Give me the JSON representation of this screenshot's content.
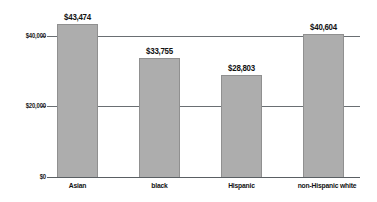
{
  "chart_data": {
    "type": "bar",
    "title": "",
    "xlabel": "",
    "ylabel": "",
    "categories": [
      "Asian",
      "black",
      "Hispanic",
      "non-Hispanic white"
    ],
    "values": [
      43474,
      40604,
      33755,
      28803
    ],
    "series": [
      {
        "name": "Median income",
        "values": [
          43474,
          33755,
          28803,
          40604
        ]
      }
    ],
    "value_labels": [
      "$43,474",
      "$33,755",
      "$28,803",
      "$40,604"
    ],
    "ylim": [
      0,
      48000
    ],
    "yticks": [
      0,
      20000,
      40000
    ],
    "ytick_labels": [
      "$0",
      "$20,000",
      "$40,000"
    ],
    "grid": true,
    "gridlines_at": [
      20000,
      40000
    ],
    "legend": "none",
    "bar_color": "#adadad",
    "bar_border_color": "#909090",
    "axis_color": "#5a5f63",
    "text_color": "#111111",
    "background": "#ffffff"
  },
  "axis": {
    "y_labels": {
      "t40": "$40,000",
      "t20": "$20,000",
      "t0": "$0"
    }
  },
  "bars": [
    {
      "category": "Asian",
      "label": "$43,474",
      "value": 43474
    },
    {
      "category": "black",
      "label": "$33,755",
      "value": 33755
    },
    {
      "category": "Hispanic",
      "label": "$28,803",
      "value": 28803
    },
    {
      "category": "non-Hispanic white",
      "label": "$40,604",
      "value": 40604
    }
  ]
}
